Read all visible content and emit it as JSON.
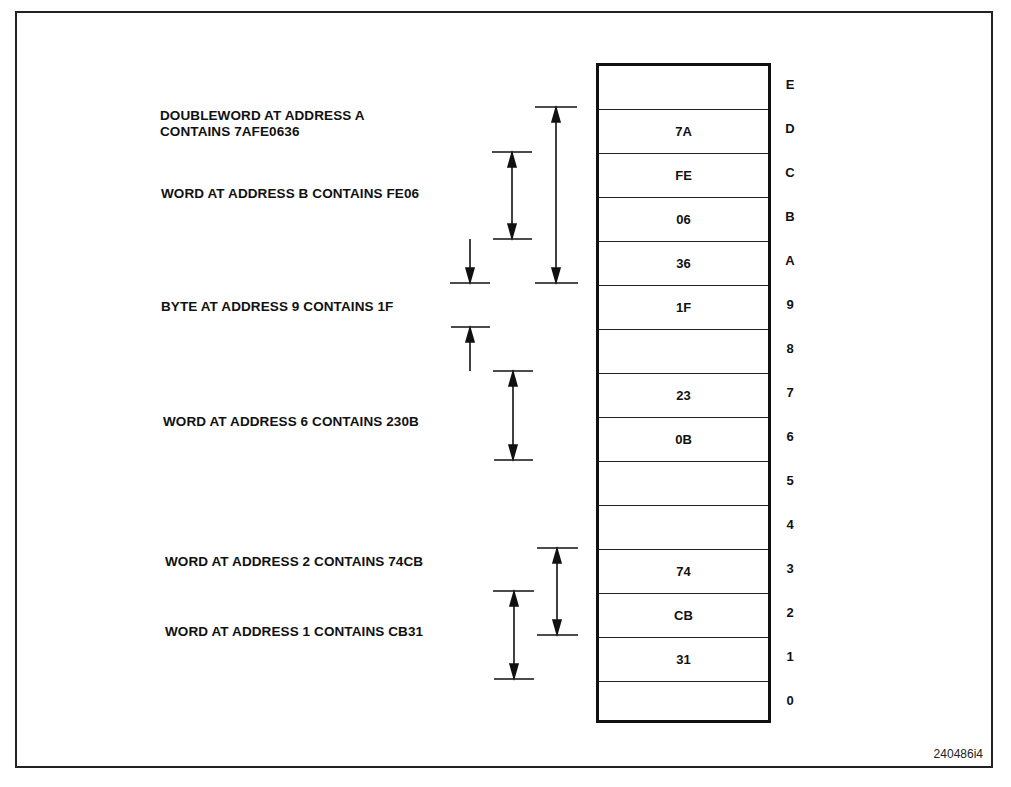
{
  "figure_id": "240486i4",
  "memory": {
    "rows": [
      {
        "address": "E",
        "value": ""
      },
      {
        "address": "D",
        "value": "7A"
      },
      {
        "address": "C",
        "value": "FE"
      },
      {
        "address": "B",
        "value": "06"
      },
      {
        "address": "A",
        "value": "36"
      },
      {
        "address": "9",
        "value": "1F"
      },
      {
        "address": "8",
        "value": ""
      },
      {
        "address": "7",
        "value": "23"
      },
      {
        "address": "6",
        "value": "0B"
      },
      {
        "address": "5",
        "value": ""
      },
      {
        "address": "4",
        "value": ""
      },
      {
        "address": "3",
        "value": "74"
      },
      {
        "address": "2",
        "value": "CB"
      },
      {
        "address": "1",
        "value": "31"
      },
      {
        "address": "0",
        "value": ""
      }
    ]
  },
  "annotations": {
    "doubleword_a_line1": "DOUBLEWORD AT ADDRESS A",
    "doubleword_a_line2": "CONTAINS 7AFE0636",
    "word_b": "WORD AT ADDRESS B CONTAINS FE06",
    "byte_9": "BYTE AT ADDRESS 9 CONTAINS 1F",
    "word_6": "WORD AT ADDRESS 6 CONTAINS 230B",
    "word_2": "WORD AT ADDRESS 2 CONTAINS 74CB",
    "word_1": "WORD AT ADDRESS 1 CONTAINS CB31"
  }
}
